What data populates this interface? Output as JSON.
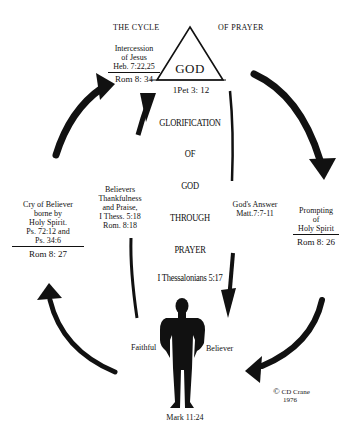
{
  "title_left": "THE CYCLE",
  "title_right": "OF PRAYER",
  "apex": {
    "label": "GOD",
    "reference": "1Pet 3: 12"
  },
  "intercession": {
    "lines": [
      "Intercession",
      "of Jesus",
      "Heb. 7:22,25"
    ],
    "reference": "Rom 8: 34"
  },
  "center_text": [
    "GLORIFICATION",
    "OF",
    "GOD",
    "THROUGH",
    "PRAYER"
  ],
  "center_reference": "I Thessalonians 5:17",
  "cry_of_believer": {
    "lines": [
      "Cry of Believer",
      "borne by",
      "Holy Spirit.",
      "Ps. 72:12 and",
      "Ps. 34:6"
    ],
    "reference": "Rom 8: 27"
  },
  "thankfulness": {
    "lines": [
      "Believers",
      "Thankfulness",
      "and Praise,",
      "I Thess. 5:18",
      "Rom. 8:18"
    ]
  },
  "gods_answer": {
    "lines": [
      "God's Answer",
      "Matt.7:7-11"
    ]
  },
  "prompting": {
    "lines": [
      "Prompting",
      "of",
      "Holy Spirit"
    ],
    "reference": "Rom 8: 26"
  },
  "figure": {
    "left_label": "Faithful",
    "right_label": "Believer",
    "reference": "Mark 11:24"
  },
  "copyright": {
    "symbol": "©",
    "author": "CD Crane",
    "year": "1976"
  },
  "colors": {
    "ink": "#111111",
    "background": "#ffffff"
  },
  "icons": [
    "triangle-icon",
    "arrow-icon",
    "person-silhouette-icon"
  ]
}
